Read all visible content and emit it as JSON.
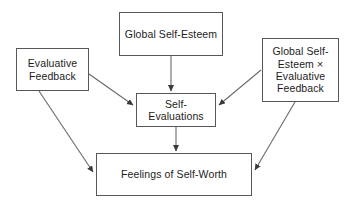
{
  "diagram": {
    "type": "path-diagram",
    "background_color": "#ffffff",
    "box_border_color": "#58585a",
    "box_fill_color": "#ffffff",
    "edge_color": "#58585a",
    "text_color": "#1c1c1c",
    "nodes": [
      {
        "id": "global-self-esteem",
        "label": "Global Self-Esteem",
        "position": "top-center"
      },
      {
        "id": "evaluative-feedback",
        "label": "Evaluative\nFeedback",
        "position": "left"
      },
      {
        "id": "interaction-term",
        "label": "Global Self-\nEsteem ×\nEvaluative\nFeedback",
        "position": "right"
      },
      {
        "id": "self-evaluations",
        "label": "Self-\nEvaluations",
        "position": "center"
      },
      {
        "id": "feelings-self-worth",
        "label": "Feelings of Self-Worth",
        "position": "bottom-center"
      }
    ],
    "edges": [
      {
        "id": "edge-global-to-self-eval",
        "from": "global-self-esteem",
        "to": "self-evaluations",
        "style": "solid-arrow"
      },
      {
        "id": "edge-feedback-to-self-eval",
        "from": "evaluative-feedback",
        "to": "self-evaluations",
        "style": "solid-arrow"
      },
      {
        "id": "edge-interaction-to-self-eval",
        "from": "interaction-term",
        "to": "self-evaluations",
        "style": "solid-arrow"
      },
      {
        "id": "edge-self-eval-to-worth",
        "from": "self-evaluations",
        "to": "feelings-self-worth",
        "style": "solid-arrow"
      },
      {
        "id": "edge-feedback-to-worth",
        "from": "evaluative-feedback",
        "to": "feelings-self-worth",
        "style": "solid-arrow"
      },
      {
        "id": "edge-interaction-to-worth",
        "from": "interaction-term",
        "to": "feelings-self-worth",
        "style": "solid-arrow"
      }
    ]
  }
}
